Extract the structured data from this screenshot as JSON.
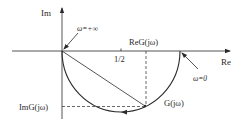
{
  "diagram": {
    "type": "nyquist-plot",
    "axes": {
      "imag_label": "Im",
      "real_label": "Re"
    },
    "tick": {
      "label": "1/2"
    },
    "annotations": {
      "omega_inf": "ω=+∞",
      "omega_zero": "ω=0",
      "re_g": "ReG(jω)",
      "im_g": "ImG(jω)",
      "g_point": "G(jω)"
    },
    "colors": {
      "stroke": "#2a2a2a",
      "background": "#ffffff"
    }
  }
}
